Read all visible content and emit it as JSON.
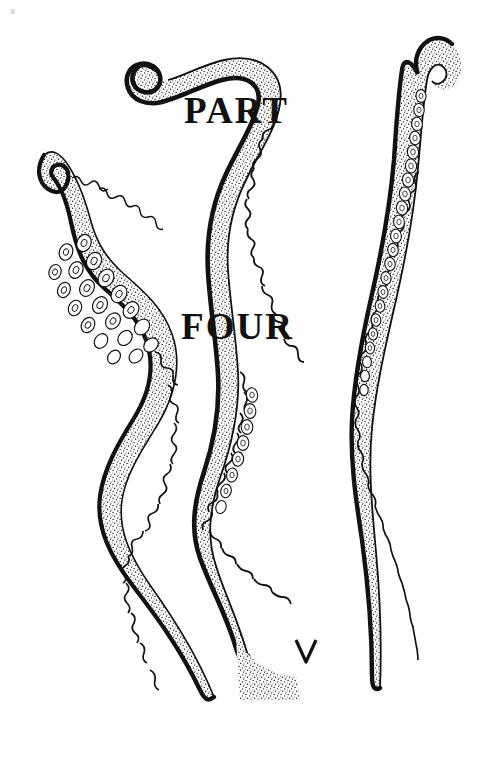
{
  "page": {
    "width": 487,
    "height": 759,
    "background_color": "#ffffff",
    "ink_color": "#111111",
    "kind": "book-part-title-page"
  },
  "title": {
    "line1": "PART",
    "line2": "FOUR"
  },
  "illustration": {
    "subject": "three octopus tentacles",
    "style": "black-and-white stipple engraving",
    "tentacles": [
      {
        "id": "left-tentacle",
        "name": "left-tentacle",
        "tip_position": "upper-left",
        "tip_shape": "hooked curl facing left",
        "suckers_side": "right",
        "sucker_count": 34,
        "fill": "stipple",
        "outline_color": "#111111"
      },
      {
        "id": "middle-tentacle",
        "name": "middle-tentacle",
        "tip_position": "top-center",
        "tip_shape": "spiral coil",
        "suckers_side": "right",
        "sucker_count": 40,
        "fill": "stipple",
        "outline_color": "#111111"
      },
      {
        "id": "right-tentacle",
        "name": "right-tentacle",
        "tip_position": "top-right",
        "tip_shape": "hook facing right",
        "suckers_side": "right",
        "sucker_count": 46,
        "fill": "stipple",
        "outline_color": "#111111"
      }
    ]
  }
}
